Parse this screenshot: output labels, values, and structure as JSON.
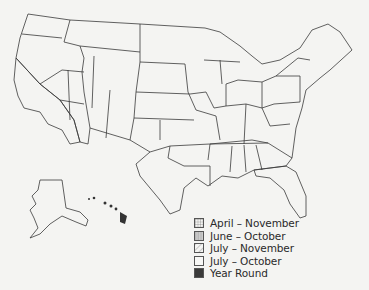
{
  "map": {
    "title": "",
    "regions": {
      "april_november": [
        "California",
        "Florida"
      ],
      "june_october": [
        "Washington",
        "Oregon",
        "Nevada",
        "Arizona (west)"
      ],
      "july_november": [
        "Texas",
        "Louisiana",
        "Mississippi",
        "Alabama",
        "Georgia",
        "South Carolina",
        "Arkansas (south)",
        "Oklahoma (south-east)"
      ],
      "july_october": [
        "All other contiguous states",
        "Alaska"
      ],
      "year_round": [
        "Hawaii"
      ]
    }
  },
  "legend": {
    "items": [
      {
        "label": "April – November",
        "pattern": "crosshatch",
        "key": "april_november"
      },
      {
        "label": "June – October",
        "pattern": "vertical-lines",
        "key": "june_october"
      },
      {
        "label": "July – November",
        "pattern": "diagonal-lines",
        "key": "july_november"
      },
      {
        "label": "July – October",
        "pattern": "blank",
        "key": "july_october"
      },
      {
        "label": "Year Round",
        "pattern": "solid-dark",
        "key": "year_round"
      }
    ]
  },
  "colors": {
    "background": "#f4f4f2",
    "outline": "#3a3a3a",
    "year_round_fill": "#3a3a3a",
    "june_october_fill": "#c8c8c8"
  }
}
